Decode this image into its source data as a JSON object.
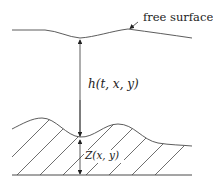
{
  "diagram": {
    "labels": {
      "free_surface": "free surface",
      "depth": "h(t, x, y)",
      "bottom": "Z(x, y)"
    },
    "colors": {
      "line": "#4a4a4a",
      "text": "#222222",
      "background": "#ffffff"
    },
    "elements": [
      "free-surface-curve",
      "free-surface-pointer-arrow",
      "depth-arrow",
      "bottom-topography-curve",
      "bottom-height-double-arrow",
      "hatched-seabed",
      "ground-line"
    ]
  }
}
